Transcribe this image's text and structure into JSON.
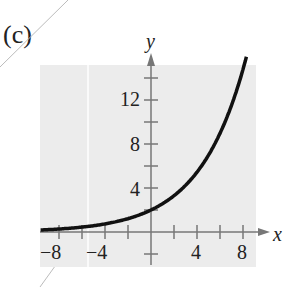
{
  "panel_label": "(c)",
  "colors": {
    "plot_bg": "#ececec",
    "axis": "#777777",
    "curve": "#111111",
    "text": "#222222"
  },
  "chart_data": {
    "type": "line",
    "title": "",
    "xlabel": "x",
    "ylabel": "y",
    "xlim": [
      -10,
      10
    ],
    "ylim": [
      -2,
      16
    ],
    "x_ticks": [
      -8,
      -6,
      -4,
      -2,
      2,
      4,
      6,
      8
    ],
    "x_tick_labels": [
      "−8",
      "−4",
      "4",
      "8"
    ],
    "y_ticks": [
      -2,
      2,
      4,
      6,
      8,
      10,
      12,
      14
    ],
    "y_tick_labels": [
      "4",
      "8",
      "12"
    ],
    "grid": false,
    "series": [
      {
        "name": "y = 2e^(x/4)",
        "x": [
          -10,
          -8,
          -6,
          -4,
          -2,
          0,
          2,
          4,
          6,
          8,
          8.3
        ],
        "y": [
          0.16,
          0.27,
          0.45,
          0.74,
          1.21,
          2.0,
          3.3,
          5.44,
          8.96,
          14.78,
          15.9
        ]
      }
    ]
  }
}
